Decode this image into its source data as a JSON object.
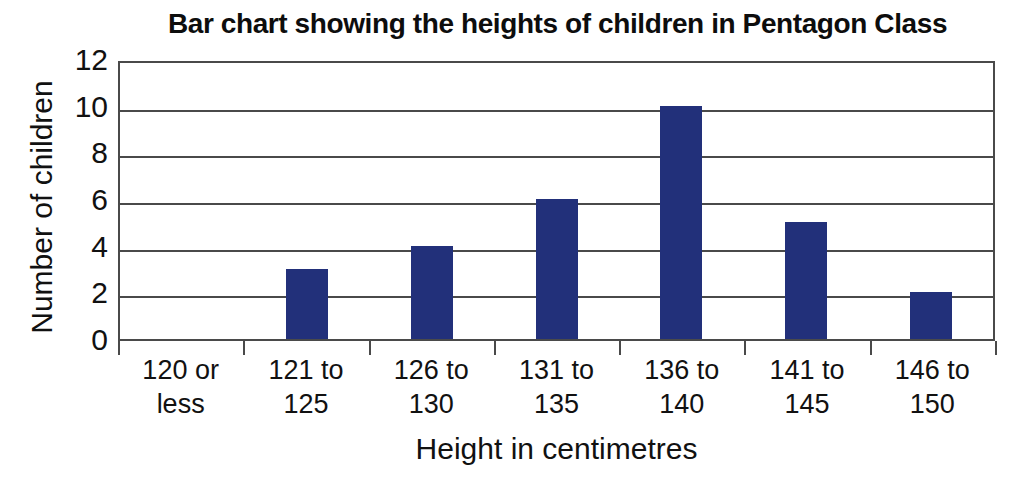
{
  "chart_data": {
    "type": "bar",
    "title": "Bar chart showing the heights of children in Pentagon Class",
    "xlabel": "Height in centimetres",
    "ylabel": "Number of children",
    "categories": [
      "120 or less",
      "121 to 125",
      "126 to 130",
      "131 to 135",
      "136 to 140",
      "141 to 145",
      "146 to 150"
    ],
    "category_lines": [
      [
        "120 or",
        "less"
      ],
      [
        "121 to",
        "125"
      ],
      [
        "126 to",
        "130"
      ],
      [
        "131 to",
        "135"
      ],
      [
        "136 to",
        "140"
      ],
      [
        "141 to",
        "145"
      ],
      [
        "146 to",
        "150"
      ]
    ],
    "values": [
      0,
      3,
      4,
      6,
      10,
      5,
      2
    ],
    "ylim": [
      0,
      12
    ],
    "ytick_labels": [
      "12",
      "10",
      "8",
      "6",
      "4",
      "2",
      "0"
    ],
    "ytick_values": [
      12,
      10,
      8,
      6,
      4,
      2,
      0
    ],
    "grid": true,
    "legend": "none",
    "bar_color": "#22307a",
    "axis_color": "#4a4a4a",
    "background_color": "#ffffff"
  }
}
